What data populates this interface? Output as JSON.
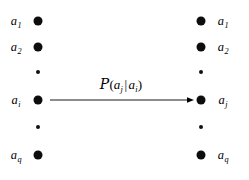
{
  "diagram": {
    "background_color": "#ffffff",
    "ink_color": "#000000",
    "width": 249,
    "height": 180,
    "left_column": {
      "name": "source-alphabet-column",
      "nodes": [
        {
          "label_base": "a",
          "label_sub": "1",
          "type": "node",
          "x": 38,
          "y": 21,
          "label_x": 16,
          "label_y": 21
        },
        {
          "label_base": "a",
          "label_sub": "2",
          "type": "node",
          "x": 38,
          "y": 47,
          "label_x": 16,
          "label_y": 47
        },
        {
          "label_base": "",
          "label_sub": "",
          "type": "ellipsis",
          "x": 38,
          "y": 72,
          "label_x": 0,
          "label_y": 0
        },
        {
          "label_base": "a",
          "label_sub": "i",
          "type": "node",
          "x": 38,
          "y": 100,
          "label_x": 16,
          "label_y": 100
        },
        {
          "label_base": "",
          "label_sub": "",
          "type": "ellipsis",
          "x": 38,
          "y": 127,
          "label_x": 0,
          "label_y": 0
        },
        {
          "label_base": "a",
          "label_sub": "q",
          "type": "node",
          "x": 38,
          "y": 155,
          "label_x": 16,
          "label_y": 155
        }
      ]
    },
    "right_column": {
      "name": "destination-alphabet-column",
      "nodes": [
        {
          "label_base": "a",
          "label_sub": "1",
          "type": "node",
          "x": 201,
          "y": 21,
          "label_x": 223,
          "label_y": 21
        },
        {
          "label_base": "a",
          "label_sub": "2",
          "type": "node",
          "x": 201,
          "y": 47,
          "label_x": 223,
          "label_y": 47
        },
        {
          "label_base": "",
          "label_sub": "",
          "type": "ellipsis",
          "x": 201,
          "y": 72,
          "label_x": 0,
          "label_y": 0
        },
        {
          "label_base": "a",
          "label_sub": "j",
          "type": "node",
          "x": 201,
          "y": 100,
          "label_x": 223,
          "label_y": 100
        },
        {
          "label_base": "",
          "label_sub": "",
          "type": "ellipsis",
          "x": 201,
          "y": 127,
          "label_x": 0,
          "label_y": 0
        },
        {
          "label_base": "a",
          "label_sub": "q",
          "type": "node",
          "x": 201,
          "y": 155,
          "label_x": 223,
          "label_y": 155
        }
      ]
    },
    "transition": {
      "name": "transition-arrow",
      "from_x": 50,
      "to_x": 194,
      "y": 100,
      "direction": "right",
      "formula": {
        "full_text": "P(a_j | a_i)",
        "operator": "ᵌ",
        "operator_glyph": "P",
        "open_paren": "(",
        "numerator_base": "a",
        "numerator_sub": "j",
        "separator": "|",
        "condition_base": "a",
        "condition_sub": "i",
        "close_paren": ")",
        "x": 121,
        "y": 84
      }
    }
  }
}
